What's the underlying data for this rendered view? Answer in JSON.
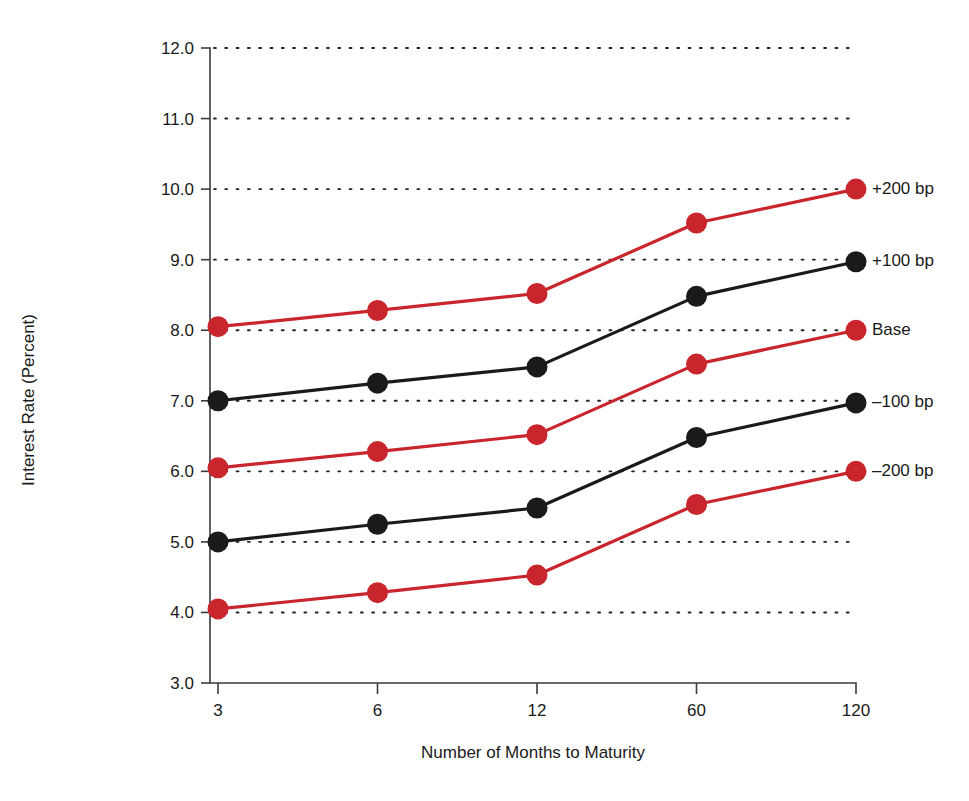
{
  "chart_data": {
    "type": "line",
    "title": "",
    "xlabel": "Number of Months to Maturity",
    "ylabel": "Interest Rate (Percent)",
    "categories": [
      "3",
      "6",
      "12",
      "60",
      "120"
    ],
    "x_tick_labels": [
      "3",
      "6",
      "12",
      "60",
      "120"
    ],
    "y_tick_labels": [
      "3.0",
      "4.0",
      "5.0",
      "6.0",
      "7.0",
      "8.0",
      "9.0",
      "10.0",
      "11.0",
      "12.0"
    ],
    "y_ticks": [
      3.0,
      4.0,
      5.0,
      6.0,
      7.0,
      8.0,
      9.0,
      10.0,
      11.0,
      12.0
    ],
    "ylim": [
      3.0,
      12.0
    ],
    "grid": "horizontal-dotted",
    "legend_position": "right-inline-labels",
    "series": [
      {
        "name": "+200 bp",
        "color": "#c8252c",
        "marker": "circle",
        "values": [
          8.05,
          8.28,
          8.52,
          9.52,
          10.0
        ]
      },
      {
        "name": "+100 bp",
        "color": "#1a1a1a",
        "marker": "circle",
        "values": [
          7.0,
          7.25,
          7.48,
          8.48,
          8.97
        ]
      },
      {
        "name": "Base",
        "color": "#c8252c",
        "marker": "circle",
        "values": [
          6.05,
          6.28,
          6.52,
          7.52,
          8.0
        ]
      },
      {
        "name": "-100 bp",
        "color": "#1a1a1a",
        "marker": "circle",
        "values": [
          5.0,
          5.25,
          5.48,
          6.48,
          6.97
        ]
      },
      {
        "name": "-200 bp",
        "color": "#c8252c",
        "marker": "circle",
        "values": [
          4.05,
          4.28,
          4.53,
          5.53,
          6.0
        ]
      }
    ],
    "series_labels": [
      "+200 bp",
      "+100 bp",
      "Base",
      "–100 bp",
      "–200 bp"
    ],
    "colors": {
      "red": "#c8252c",
      "black": "#1a1a1a",
      "axis": "#3a3a3a",
      "background": "#ffffff"
    }
  }
}
